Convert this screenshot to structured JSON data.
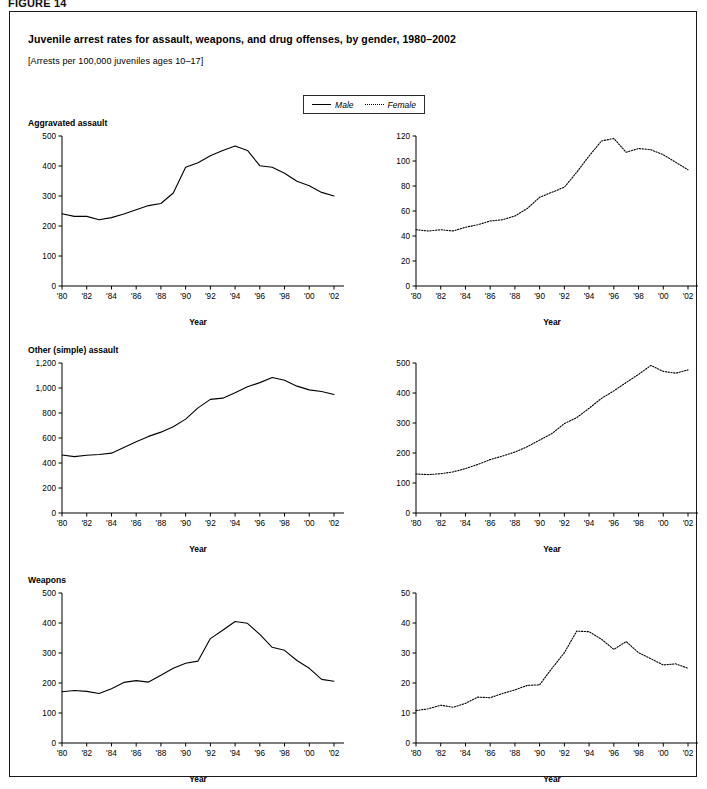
{
  "figure": {
    "label": "FIGURE 14",
    "title": "Juvenile arrest rates for assault, weapons, and drug offenses, by gender, 1980–2002",
    "subtitle": "[Arrests per 100,000 juveniles ages 10–17]"
  },
  "legend": {
    "position": "top-center",
    "entries": [
      {
        "label": "Male",
        "style": "solid"
      },
      {
        "label": "Female",
        "style": "dotted"
      }
    ]
  },
  "axis": {
    "xlabel": "Year",
    "xtick_labels": [
      "'80",
      "'82",
      "'84",
      "'86",
      "'88",
      "'90",
      "'92",
      "'94",
      "'96",
      "'98",
      "'00",
      "'02"
    ]
  },
  "chart_data": [
    {
      "type": "line",
      "panel": "aggravated-assault-male",
      "title": "Aggravated assault",
      "series_name": "Male",
      "style": "solid",
      "xlabel": "Year",
      "ylabel": "",
      "grid": false,
      "xlim": [
        1980,
        2002
      ],
      "ylim": [
        0,
        500
      ],
      "yticks": [
        0,
        100,
        200,
        300,
        400,
        500
      ],
      "ytick_labels": [
        "0",
        "100",
        "200",
        "300",
        "400",
        "500"
      ],
      "x": [
        1980,
        1981,
        1982,
        1983,
        1984,
        1985,
        1986,
        1987,
        1988,
        1989,
        1990,
        1991,
        1992,
        1993,
        1994,
        1995,
        1996,
        1997,
        1998,
        1999,
        2000,
        2001,
        2002
      ],
      "values": [
        241,
        232,
        232,
        221,
        228,
        240,
        254,
        268,
        275,
        310,
        396,
        411,
        434,
        452,
        467,
        452,
        401,
        396,
        376,
        349,
        334,
        312,
        300
      ]
    },
    {
      "type": "line",
      "panel": "aggravated-assault-female",
      "title": "Aggravated assault",
      "series_name": "Female",
      "style": "dotted",
      "xlabel": "Year",
      "ylabel": "",
      "grid": false,
      "xlim": [
        1980,
        2002
      ],
      "ylim": [
        0,
        120
      ],
      "yticks": [
        0,
        20,
        40,
        60,
        80,
        100,
        120
      ],
      "ytick_labels": [
        "0",
        "20",
        "40",
        "60",
        "80",
        "100",
        "120"
      ],
      "x": [
        1980,
        1981,
        1982,
        1983,
        1984,
        1985,
        1986,
        1987,
        1988,
        1989,
        1990,
        1991,
        1992,
        1993,
        1994,
        1995,
        1996,
        1997,
        1998,
        1999,
        2000,
        2001,
        2002
      ],
      "values": [
        45,
        44,
        45,
        44,
        47,
        49,
        52,
        53,
        56,
        62,
        71,
        75,
        79,
        91,
        104,
        116,
        118,
        107,
        110,
        109,
        105,
        99,
        93
      ]
    },
    {
      "type": "line",
      "panel": "other-simple-assault-male",
      "title": "Other (simple) assault",
      "series_name": "Male",
      "style": "solid",
      "xlabel": "Year",
      "ylabel": "",
      "grid": false,
      "xlim": [
        1980,
        2002
      ],
      "ylim": [
        0,
        1200
      ],
      "yticks": [
        0,
        200,
        400,
        600,
        800,
        1000,
        1200
      ],
      "ytick_labels": [
        "0",
        "200",
        "400",
        "600",
        "800",
        "1,000",
        "1,200"
      ],
      "x": [
        1980,
        1981,
        1982,
        1983,
        1984,
        1985,
        1986,
        1987,
        1988,
        1989,
        1990,
        1991,
        1992,
        1993,
        1994,
        1995,
        1996,
        1997,
        1998,
        1999,
        2000,
        2001,
        2002
      ],
      "values": [
        464,
        451,
        462,
        468,
        479,
        524,
        570,
        613,
        647,
        690,
        751,
        841,
        909,
        919,
        962,
        1010,
        1043,
        1084,
        1062,
        1015,
        985,
        972,
        948
      ]
    },
    {
      "type": "line",
      "panel": "other-simple-assault-female",
      "title": "Other (simple) assault",
      "series_name": "Female",
      "style": "dotted",
      "xlabel": "Year",
      "ylabel": "",
      "grid": false,
      "xlim": [
        1980,
        2002
      ],
      "ylim": [
        0,
        500
      ],
      "yticks": [
        0,
        100,
        200,
        300,
        400,
        500
      ],
      "ytick_labels": [
        "0",
        "100",
        "200",
        "300",
        "400",
        "500"
      ],
      "x": [
        1980,
        1981,
        1982,
        1983,
        1984,
        1985,
        1986,
        1987,
        1988,
        1989,
        1990,
        1991,
        1992,
        1993,
        1994,
        1995,
        1996,
        1997,
        1998,
        1999,
        2000,
        2001,
        2002
      ],
      "values": [
        130,
        128,
        131,
        137,
        148,
        162,
        178,
        190,
        203,
        221,
        243,
        265,
        298,
        318,
        349,
        382,
        407,
        435,
        462,
        492,
        472,
        466,
        477
      ]
    },
    {
      "type": "line",
      "panel": "weapons-male",
      "title": "Weapons",
      "series_name": "Male",
      "style": "solid",
      "xlabel": "Year",
      "ylabel": "",
      "grid": false,
      "xlim": [
        1980,
        2002
      ],
      "ylim": [
        0,
        500
      ],
      "yticks": [
        0,
        100,
        200,
        300,
        400,
        500
      ],
      "ytick_labels": [
        "0",
        "100",
        "200",
        "300",
        "400",
        "500"
      ],
      "x": [
        1980,
        1981,
        1982,
        1983,
        1984,
        1985,
        1986,
        1987,
        1988,
        1989,
        1990,
        1991,
        1992,
        1993,
        1994,
        1995,
        1996,
        1997,
        1998,
        1999,
        2000,
        2001,
        2002
      ],
      "values": [
        171,
        175,
        172,
        165,
        181,
        202,
        208,
        203,
        226,
        249,
        266,
        273,
        348,
        376,
        405,
        399,
        362,
        319,
        309,
        275,
        249,
        212,
        206
      ]
    },
    {
      "type": "line",
      "panel": "weapons-female",
      "title": "Weapons",
      "series_name": "Female",
      "style": "dotted",
      "xlabel": "Year",
      "ylabel": "",
      "grid": false,
      "xlim": [
        1980,
        2002
      ],
      "ylim": [
        0,
        50
      ],
      "yticks": [
        0,
        10,
        20,
        30,
        40,
        50
      ],
      "ytick_labels": [
        "0",
        "10",
        "20",
        "30",
        "40",
        "50"
      ],
      "x": [
        1980,
        1981,
        1982,
        1983,
        1984,
        1985,
        1986,
        1987,
        1988,
        1989,
        1990,
        1991,
        1992,
        1993,
        1994,
        1995,
        1996,
        1997,
        1998,
        1999,
        2000,
        2001,
        2002
      ],
      "values": [
        10.8,
        11.4,
        12.6,
        11.9,
        13.2,
        15.3,
        15.1,
        16.5,
        17.7,
        19.2,
        19.4,
        24.9,
        30.1,
        37.3,
        37.1,
        34.6,
        31.2,
        33.8,
        30.1,
        28.1,
        26.0,
        26.4,
        24.9
      ]
    }
  ],
  "panel_layout": [
    {
      "panel": "aggravated-assault-male",
      "show_heading": true,
      "left": 18,
      "top": 106
    },
    {
      "panel": "aggravated-assault-female",
      "show_heading": false,
      "left": 372,
      "top": 106
    },
    {
      "panel": "other-simple-assault-male",
      "show_heading": true,
      "left": 18,
      "top": 333
    },
    {
      "panel": "other-simple-assault-female",
      "show_heading": false,
      "left": 372,
      "top": 333
    },
    {
      "panel": "weapons-male",
      "show_heading": true,
      "left": 18,
      "top": 563
    },
    {
      "panel": "weapons-female",
      "show_heading": false,
      "left": 372,
      "top": 563
    }
  ]
}
